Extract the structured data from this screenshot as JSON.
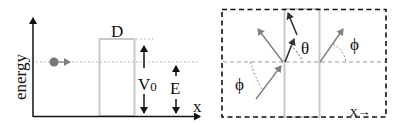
{
  "left_panel": {
    "y_axis_label": "energy",
    "x_axis_label": "x",
    "barrier_width_label": "D",
    "barrier_height_label": "V",
    "barrier_height_subscript": "0",
    "particle_energy_label": "E"
  },
  "right_panel": {
    "angle_inside_label": "θ",
    "angle_incident_label": "ϕ",
    "angle_transmitted_label": "ϕ",
    "direction_label": "x",
    "direction_arrow": "→"
  },
  "colors": {
    "axis": "#111111",
    "barrier": "#c8c8c8",
    "particle": "#777777",
    "ray": "#808080",
    "ray_inside": "#333333",
    "dashed_box": "#111111",
    "dotted": "#aaaaaa"
  }
}
